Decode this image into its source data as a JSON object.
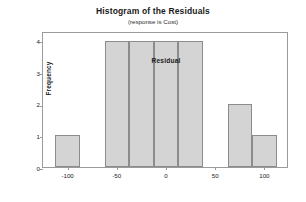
{
  "chart_data": {
    "type": "bar",
    "title": "Histogram of the Residuals",
    "subtitle": "(response is Cost)",
    "xlabel": "Residual",
    "ylabel": "Frequency",
    "xlim": [
      -125,
      125
    ],
    "ylim": [
      0,
      4.3
    ],
    "grid": false,
    "legend": null,
    "bin_width": 25,
    "x_ticks": [
      -100,
      -50,
      0,
      50,
      100
    ],
    "x_tick_labels": [
      "-100",
      "-50",
      "0",
      "50",
      "100"
    ],
    "y_ticks": [
      0,
      1,
      2,
      3,
      4
    ],
    "y_tick_labels": [
      "0",
      "1",
      "2",
      "3",
      "4"
    ],
    "bins": [
      {
        "left": -112.5,
        "right": -87.5,
        "center": -100,
        "value": 1
      },
      {
        "left": -62.5,
        "right": -37.5,
        "center": -50,
        "value": 4
      },
      {
        "left": -37.5,
        "right": -12.5,
        "center": -25,
        "value": 4
      },
      {
        "left": -12.5,
        "right": 12.5,
        "center": 0,
        "value": 4
      },
      {
        "left": 12.5,
        "right": 37.5,
        "center": 25,
        "value": 4
      },
      {
        "left": 62.5,
        "right": 87.5,
        "center": 75,
        "value": 2
      },
      {
        "left": 87.5,
        "right": 112.5,
        "center": 100,
        "value": 1
      }
    ],
    "categories": [
      "-100",
      "-50",
      "-25",
      "0",
      "25",
      "75",
      "100"
    ],
    "values": [
      1,
      4,
      4,
      4,
      4,
      2,
      1
    ],
    "colors": {
      "bar_fill": "#d4d4d4",
      "bar_edge": "#8c8c8c",
      "frame": "#9a9a9a",
      "text": "#1a1a1a",
      "background": "#ffffff"
    }
  }
}
